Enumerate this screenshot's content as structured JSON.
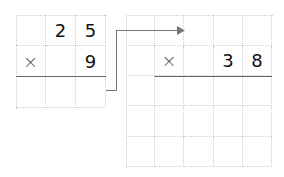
{
  "left_problem": {
    "rows": [
      [
        "",
        "2",
        "5"
      ],
      [
        "×",
        "",
        "9"
      ],
      [
        "",
        "",
        ""
      ]
    ]
  },
  "right_problem": {
    "rows": [
      [
        "",
        "",
        "",
        "",
        ""
      ],
      [
        "",
        "×",
        "",
        "3",
        "8"
      ],
      [
        "",
        "",
        "",
        "",
        ""
      ],
      [
        "",
        "",
        "",
        "",
        ""
      ],
      [
        "",
        "",
        "",
        "",
        ""
      ]
    ]
  },
  "colors": {
    "grid": "#cfcfcf",
    "rule": "#666666",
    "arrow": "#777777",
    "digit": "#111111"
  }
}
